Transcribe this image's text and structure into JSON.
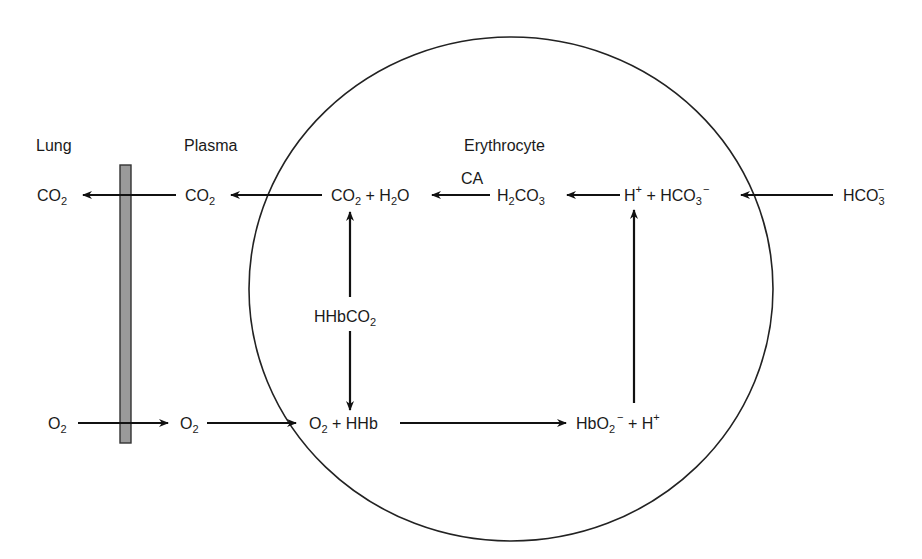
{
  "diagram": {
    "title_regions": {
      "lung": "Lung",
      "plasma": "Plasma",
      "erythrocyte": "Erythrocyte"
    },
    "colors": {
      "stroke": "#111111",
      "text": "#1a1a1a",
      "membrane_fill": "#9a9a9a",
      "background": "#ffffff"
    },
    "nodes": {
      "lung_co2": {
        "base": "CO",
        "sub": "2"
      },
      "plasma_co2": {
        "base": "CO",
        "sub": "2"
      },
      "rbc_co2_h2o": {
        "p1": "CO",
        "s1": "2",
        "p2": " + H",
        "s2": "2",
        "p3": "O"
      },
      "enzyme_ca": "CA",
      "h2co3": {
        "p1": "H",
        "s1": "2",
        "p2": "CO",
        "s2": "3"
      },
      "h_hco3": {
        "p1": "H",
        "sup1": "+",
        "p2": " + HCO",
        "s2": "3",
        "sup2": "−"
      },
      "plasma_hco3": {
        "p1": "HCO",
        "s1": "3",
        "sup1": "−"
      },
      "hhbco2": {
        "p1": "HHbCO",
        "s1": "2"
      },
      "lung_o2": {
        "base": "O",
        "sub": "2"
      },
      "plasma_o2": {
        "base": "O",
        "sub": "2"
      },
      "o2_hhb": {
        "p1": "O",
        "s1": "2",
        "p2": " + HHb"
      },
      "hbo2_h": {
        "p1": "HbO",
        "s1": "2",
        "sup1": "−",
        "p2": " + H",
        "sup2": "+"
      }
    },
    "arrows": [
      {
        "from": "plasma_co2",
        "to": "lung_co2"
      },
      {
        "from": "rbc_co2_h2o",
        "to": "plasma_co2"
      },
      {
        "from": "h2co3",
        "to": "rbc_co2_h2o",
        "label": "CA"
      },
      {
        "from": "h_hco3",
        "to": "h2co3"
      },
      {
        "from": "plasma_hco3",
        "to": "h_hco3"
      },
      {
        "from": "hhbco2",
        "to": "rbc_co2_h2o"
      },
      {
        "from": "hhbco2",
        "to": "o2_hhb"
      },
      {
        "from": "lung_o2",
        "to": "plasma_o2"
      },
      {
        "from": "plasma_o2",
        "to": "o2_hhb"
      },
      {
        "from": "o2_hhb",
        "to": "hbo2_h"
      },
      {
        "from": "hbo2_h",
        "to": "h_hco3"
      }
    ]
  }
}
